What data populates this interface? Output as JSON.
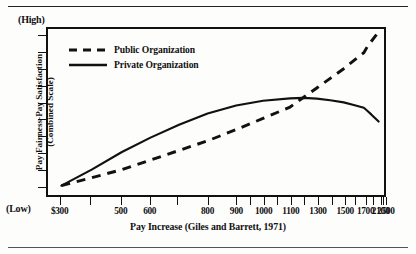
{
  "figure": {
    "high_marker": "(High)",
    "low_marker": "(Low)",
    "y_axis_title_line1": "Pay Fairness-Pay Satisfaction",
    "y_axis_title_line2": "(Combined Scale)",
    "x_axis_title": "Pay Increase (Giles and Barrett, 1971)"
  },
  "chart_data": {
    "type": "line",
    "title": "",
    "xlabel": "Pay Increase (Giles and Barrett, 1971)",
    "ylabel": "Pay Fairness-Pay Satisfaction (Combined Scale)",
    "x_tick_labels": [
      "$300",
      "500",
      "600",
      "800",
      "900",
      "1000",
      "1100",
      "1300",
      "1500",
      "1700",
      "2100",
      "2500"
    ],
    "x_tick_values": [
      300,
      500,
      600,
      800,
      900,
      1000,
      1100,
      1300,
      1500,
      1700,
      2100,
      2500
    ],
    "x_tick_positions_pct": [
      4.0,
      22.0,
      30.5,
      47.5,
      56.0,
      64.0,
      72.0,
      80.0,
      88.0,
      94.0,
      98.4,
      100.0
    ],
    "x_minor_tick_positions_pct": [
      13.0,
      38.5,
      60.0,
      68.0,
      76.0,
      84.0,
      91.0,
      96.3,
      99.2
    ],
    "ylim_labels": [
      "(Low)",
      "(High)"
    ],
    "y_tick_count": 10,
    "grid": false,
    "legend_position": "upper-left-inside",
    "series": [
      {
        "name": "Public Organization",
        "style": "dashed",
        "color": "#111111",
        "x": [
          300,
          400,
          500,
          600,
          700,
          800,
          900,
          1000,
          1100,
          1200,
          1300,
          1400,
          1500,
          1600,
          1700,
          1800,
          1900,
          2000,
          2100
        ],
        "y": [
          4,
          9,
          14,
          20,
          26,
          32,
          39,
          46,
          53,
          59,
          65,
          71,
          77,
          82,
          87,
          91,
          94,
          97,
          100
        ]
      },
      {
        "name": "Private Organization",
        "style": "solid",
        "color": "#111111",
        "x": [
          300,
          400,
          500,
          600,
          700,
          800,
          900,
          1000,
          1100,
          1200,
          1300,
          1400,
          1500,
          1600,
          1700,
          1800,
          1900,
          2000,
          2100
        ],
        "y": [
          4,
          14,
          25,
          34,
          42,
          49,
          54,
          57,
          58.5,
          58.8,
          58.3,
          57.3,
          56.0,
          54.4,
          52.6,
          50.6,
          48.5,
          46.2,
          44.0
        ]
      }
    ],
    "annotations": [
      {
        "text": "(High)",
        "position": "above-y-axis-top"
      },
      {
        "text": "(Low)",
        "position": "left-of-x-axis-start"
      }
    ]
  },
  "legend": {
    "items": [
      {
        "label": "Public Organization",
        "style": "dashed"
      },
      {
        "label": "Private Organization",
        "style": "solid"
      }
    ]
  }
}
